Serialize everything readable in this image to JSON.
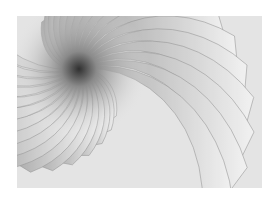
{
  "image": {
    "description": "Abstract grayscale spiral of overlapping curved petal/fin shapes radiating from a dark center near the upper-left",
    "colors": {
      "background": "#ffffff",
      "light": "#f2f2f2",
      "mid": "#b8b8b8",
      "dark": "#3a3a3a"
    }
  }
}
